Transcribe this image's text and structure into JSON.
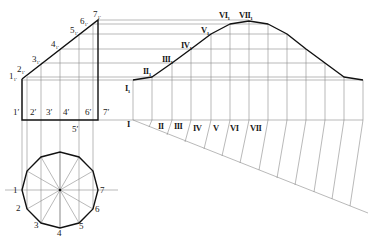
{
  "colors": {
    "background": "#ffffff",
    "outline": "#111111",
    "construction": "#8a8a8a",
    "text": "#1a1a1a"
  },
  "front_view": {
    "top_labels": [
      {
        "text": "1",
        "sub": "1'",
        "x": 9,
        "y": 79
      },
      {
        "text": "2",
        "sub": "1'",
        "x": 17,
        "y": 72
      },
      {
        "text": "3",
        "sub": "1'",
        "x": 32,
        "y": 62
      },
      {
        "text": "4",
        "sub": "1'",
        "x": 51,
        "y": 47
      },
      {
        "text": "5",
        "sub": "1'",
        "x": 70,
        "y": 33
      },
      {
        "text": "6",
        "sub": "1'",
        "x": 80,
        "y": 24
      },
      {
        "text": "7",
        "sub": "1'",
        "x": 93,
        "y": 17
      }
    ],
    "bottom_labels": [
      {
        "text": "1′",
        "x": 13,
        "y": 115
      },
      {
        "text": "2′",
        "x": 30,
        "y": 115
      },
      {
        "text": "3′",
        "x": 46,
        "y": 115
      },
      {
        "text": "4′",
        "x": 63,
        "y": 115
      },
      {
        "text": "5′",
        "x": 72,
        "y": 132
      },
      {
        "text": "6′",
        "x": 85,
        "y": 115
      },
      {
        "text": "7′",
        "x": 103,
        "y": 115
      }
    ]
  },
  "top_view": {
    "center": [
      60,
      190
    ],
    "radius": 38,
    "labels": [
      {
        "text": "1",
        "x": 13,
        "y": 193
      },
      {
        "text": "2",
        "x": 16,
        "y": 211
      },
      {
        "text": "3",
        "x": 34,
        "y": 228
      },
      {
        "text": "4",
        "x": 57,
        "y": 236
      },
      {
        "text": "5",
        "x": 79,
        "y": 229
      },
      {
        "text": "6",
        "x": 95,
        "y": 212
      },
      {
        "text": "7",
        "x": 100,
        "y": 193
      }
    ]
  },
  "development": {
    "curve_labels": [
      {
        "text": "I",
        "sub": "1",
        "x": 125,
        "y": 91
      },
      {
        "text": "II",
        "sub": "1",
        "x": 143,
        "y": 74
      },
      {
        "text": "III",
        "sub": "1",
        "x": 162,
        "y": 62
      },
      {
        "text": "IV",
        "sub": "1",
        "x": 181,
        "y": 48
      },
      {
        "text": "V",
        "sub": "1",
        "x": 201,
        "y": 33
      },
      {
        "text": "VI",
        "sub": "1",
        "x": 219,
        "y": 18
      },
      {
        "text": "VII",
        "sub": "1",
        "x": 239,
        "y": 18
      }
    ],
    "base_labels": [
      {
        "text": "I",
        "x": 127,
        "y": 127
      },
      {
        "text": "II",
        "x": 158,
        "y": 129
      },
      {
        "text": "III",
        "x": 174,
        "y": 129
      },
      {
        "text": "IV",
        "x": 193,
        "y": 131
      },
      {
        "text": "V",
        "x": 213,
        "y": 131
      },
      {
        "text": "VI",
        "x": 230,
        "y": 131
      },
      {
        "text": "VII",
        "x": 250,
        "y": 131
      }
    ]
  }
}
